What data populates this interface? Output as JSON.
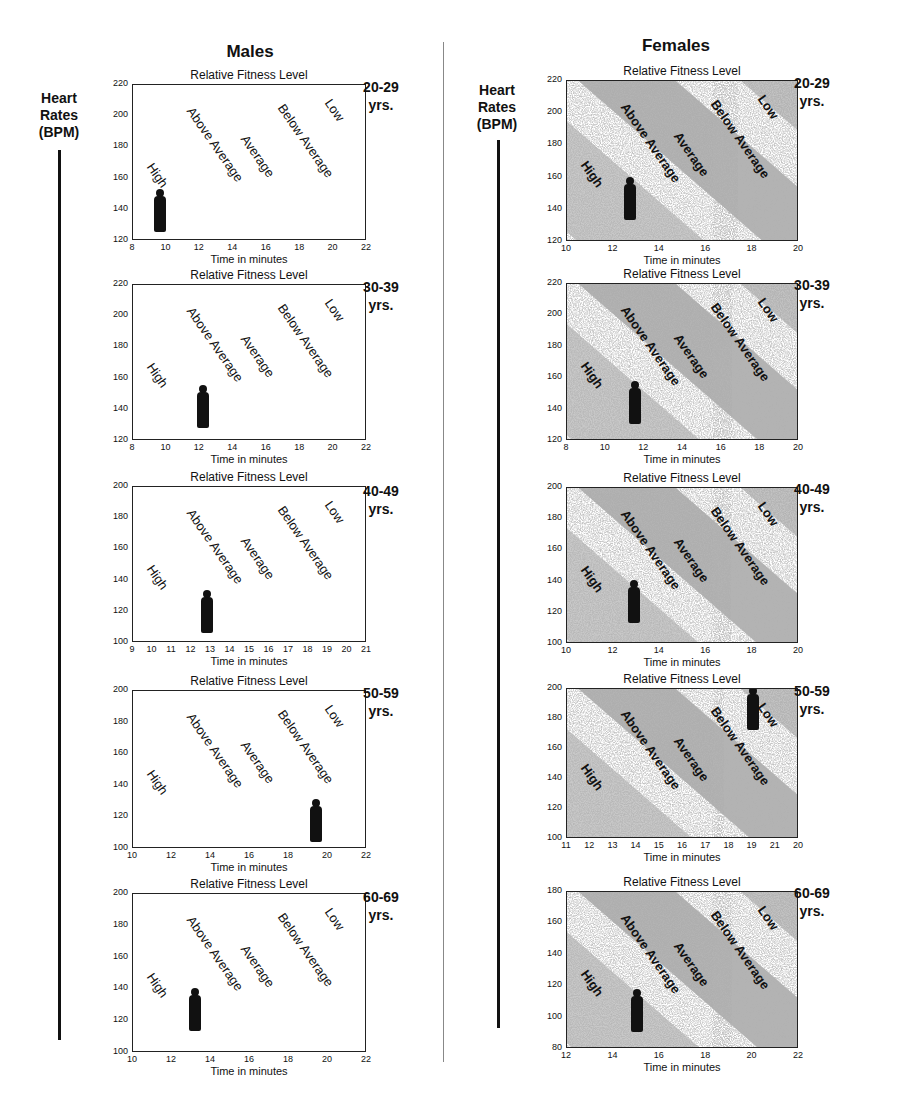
{
  "header": {
    "males": "Males",
    "females": "Females",
    "y_axis_label_line1": "Heart",
    "y_axis_label_line2": "Rates",
    "y_axis_label_line3": "(BPM)"
  },
  "zones": [
    "High",
    "Above Average",
    "Average",
    "Below Average",
    "Low"
  ],
  "colors": {
    "ink": "#111111",
    "band_dark": "#8a8a8a",
    "band_light": "#d0d0d0",
    "background": "#ffffff"
  },
  "chart_data": [
    {
      "type": "scatter",
      "group": "Males",
      "age": "20-29",
      "age_unit": "yrs.",
      "title": "Relative Fitness Level",
      "xlabel": "Time in minutes",
      "ylabel": "Heart Rates (BPM)",
      "xticks": [
        "8",
        "10",
        "12",
        "14",
        "16",
        "18",
        "20",
        "22"
      ],
      "yticks": [
        "220",
        "200",
        "180",
        "160",
        "140",
        "120"
      ],
      "xlim": [
        8,
        22
      ],
      "ylim": [
        120,
        220
      ],
      "grid": false,
      "zones": [
        "High",
        "Above Average",
        "Average",
        "Below Average",
        "Low"
      ],
      "figure_position": {
        "x": 9.6,
        "y": 137
      },
      "shaded_bands": false
    },
    {
      "type": "scatter",
      "group": "Males",
      "age": "30-39",
      "age_unit": "yrs.",
      "title": "Relative Fitness Level",
      "xlabel": "Time in minutes",
      "ylabel": "Heart Rates (BPM)",
      "xticks": [
        "8",
        "10",
        "12",
        "14",
        "16",
        "18",
        "20",
        "22"
      ],
      "yticks": [
        "220",
        "200",
        "180",
        "160",
        "140",
        "120"
      ],
      "xlim": [
        8,
        22
      ],
      "ylim": [
        120,
        220
      ],
      "grid": false,
      "zones": [
        "High",
        "Above Average",
        "Average",
        "Below Average",
        "Low"
      ],
      "figure_position": {
        "x": 12.2,
        "y": 140
      },
      "shaded_bands": false
    },
    {
      "type": "scatter",
      "group": "Males",
      "age": "40-49",
      "age_unit": "yrs.",
      "title": "Relative Fitness Level",
      "xlabel": "Time in minutes",
      "ylabel": "Heart Rates (BPM)",
      "xticks": [
        "9",
        "10",
        "11",
        "12",
        "13",
        "14",
        "15",
        "16",
        "17",
        "18",
        "19",
        "20",
        "21"
      ],
      "yticks": [
        "200",
        "180",
        "160",
        "140",
        "120",
        "100"
      ],
      "xlim": [
        9,
        21
      ],
      "ylim": [
        100,
        200
      ],
      "grid": false,
      "zones": [
        "High",
        "Above Average",
        "Average",
        "Below Average",
        "Low"
      ],
      "figure_position": {
        "x": 12.8,
        "y": 118
      },
      "shaded_bands": false
    },
    {
      "type": "scatter",
      "group": "Males",
      "age": "50-59",
      "age_unit": "yrs.",
      "title": "Relative Fitness Level",
      "xlabel": "Time in minutes",
      "ylabel": "Heart Rates (BPM)",
      "xticks": [
        "10",
        "12",
        "14",
        "16",
        "18",
        "20",
        "22"
      ],
      "yticks": [
        "200",
        "180",
        "160",
        "140",
        "120",
        "100"
      ],
      "xlim": [
        10,
        22
      ],
      "ylim": [
        100,
        200
      ],
      "grid": false,
      "zones": [
        "High",
        "Above Average",
        "Average",
        "Below Average",
        "Low"
      ],
      "figure_position": {
        "x": 19.4,
        "y": 116
      },
      "shaded_bands": false
    },
    {
      "type": "scatter",
      "group": "Males",
      "age": "60-69",
      "age_unit": "yrs.",
      "title": "Relative Fitness Level",
      "xlabel": "Time in minutes",
      "ylabel": "Heart Rates (BPM)",
      "xticks": [
        "10",
        "12",
        "14",
        "16",
        "18",
        "20",
        "22"
      ],
      "yticks": [
        "200",
        "180",
        "160",
        "140",
        "120",
        "100"
      ],
      "xlim": [
        10,
        22
      ],
      "ylim": [
        100,
        200
      ],
      "grid": false,
      "zones": [
        "High",
        "Above Average",
        "Average",
        "Below Average",
        "Low"
      ],
      "figure_position": {
        "x": 13.2,
        "y": 125
      },
      "shaded_bands": false
    },
    {
      "type": "scatter",
      "group": "Females",
      "age": "20-29",
      "age_unit": "yrs.",
      "title": "Relative Fitness Level",
      "xlabel": "Time in minutes",
      "ylabel": "Heart Rates (BPM)",
      "xticks": [
        "10",
        "12",
        "14",
        "16",
        "18",
        "20"
      ],
      "yticks": [
        "220",
        "200",
        "180",
        "160",
        "140",
        "120"
      ],
      "xlim": [
        10,
        20
      ],
      "ylim": [
        120,
        220
      ],
      "grid": false,
      "zones": [
        "High",
        "Above Average",
        "Average",
        "Below Average",
        "Low"
      ],
      "figure_position": {
        "x": 12.7,
        "y": 145
      },
      "shaded_bands": true
    },
    {
      "type": "scatter",
      "group": "Females",
      "age": "30-39",
      "age_unit": "yrs.",
      "title": "Relative Fitness Level",
      "xlabel": "Time in minutes",
      "ylabel": "Heart Rates (BPM)",
      "xticks": [
        "8",
        "10",
        "12",
        "14",
        "16",
        "18",
        "20"
      ],
      "yticks": [
        "220",
        "200",
        "180",
        "160",
        "140",
        "120"
      ],
      "xlim": [
        8,
        20
      ],
      "ylim": [
        120,
        220
      ],
      "grid": false,
      "zones": [
        "High",
        "Above Average",
        "Average",
        "Below Average",
        "Low"
      ],
      "figure_position": {
        "x": 11.5,
        "y": 142
      },
      "shaded_bands": true
    },
    {
      "type": "scatter",
      "group": "Females",
      "age": "40-49",
      "age_unit": "yrs.",
      "title": "Relative Fitness Level",
      "xlabel": "Time in minutes",
      "ylabel": "Heart Rates (BPM)",
      "xticks": [
        "10",
        "12",
        "14",
        "16",
        "18",
        "20"
      ],
      "yticks": [
        "200",
        "180",
        "160",
        "140",
        "120",
        "100"
      ],
      "xlim": [
        10,
        20
      ],
      "ylim": [
        100,
        200
      ],
      "grid": false,
      "zones": [
        "High",
        "Above Average",
        "Average",
        "Below Average",
        "Low"
      ],
      "figure_position": {
        "x": 12.9,
        "y": 125
      },
      "shaded_bands": true
    },
    {
      "type": "scatter",
      "group": "Females",
      "age": "50-59",
      "age_unit": "yrs.",
      "title": "Relative Fitness Level",
      "xlabel": "Time in minutes",
      "ylabel": "Heart Rates (BPM)",
      "xticks": [
        "11",
        "12",
        "13",
        "14",
        "15",
        "16",
        "17",
        "18",
        "19",
        "21",
        "20"
      ],
      "yticks": [
        "200",
        "180",
        "160",
        "140",
        "120",
        "100"
      ],
      "xlim": [
        11,
        21
      ],
      "ylim": [
        100,
        200
      ],
      "grid": false,
      "zones": [
        "High",
        "Above Average",
        "Average",
        "Below Average",
        "Low"
      ],
      "figure_position": {
        "x": 19.0,
        "y": 185
      },
      "shaded_bands": true
    },
    {
      "type": "scatter",
      "group": "Females",
      "age": "60-69",
      "age_unit": "yrs.",
      "title": "Relative Fitness Level",
      "xlabel": "Time in minutes",
      "ylabel": "Heart Rates (BPM)",
      "xticks": [
        "12",
        "14",
        "16",
        "18",
        "20",
        "22"
      ],
      "yticks": [
        "180",
        "160",
        "140",
        "120",
        "100",
        "80"
      ],
      "xlim": [
        12,
        22
      ],
      "ylim": [
        80,
        180
      ],
      "grid": false,
      "zones": [
        "High",
        "Above Average",
        "Average",
        "Below Average",
        "Low"
      ],
      "figure_position": {
        "x": 15.0,
        "y": 102
      },
      "shaded_bands": true
    }
  ]
}
